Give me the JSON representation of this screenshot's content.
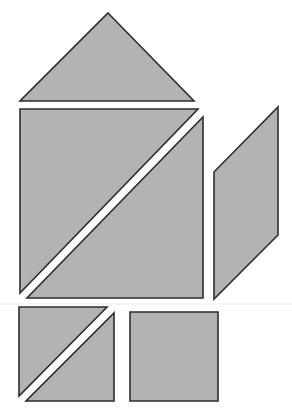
{
  "diagram": {
    "title": "",
    "colors": {
      "fill": "#b3b3b3",
      "stroke": "#2e2e2e",
      "background": "#ffffff",
      "faint_line": "#eeeeee"
    },
    "pieces": [
      {
        "id": "top-triangle",
        "shape": "triangle",
        "points": "108,13 194,101 20,101"
      },
      {
        "id": "big-triangle-upper-left",
        "shape": "triangle",
        "points": "20,109 198,109 20,293"
      },
      {
        "id": "big-triangle-lower-right",
        "shape": "triangle",
        "points": "203,117 203,298 27,298"
      },
      {
        "id": "parallelogram",
        "shape": "parallelogram",
        "points": "278,107 278,235 214,299 214,172"
      },
      {
        "id": "small-triangle-upper-left",
        "shape": "triangle",
        "points": "19,307 107,307 19,396"
      },
      {
        "id": "small-triangle-lower-right",
        "shape": "triangle",
        "points": "114,313 114,401 26,401"
      },
      {
        "id": "square",
        "shape": "square",
        "points": "130,312 218,312 218,401 130,401"
      }
    ],
    "faint_line": {
      "x1": 0,
      "y1": 304,
      "x2": 292,
      "y2": 304
    }
  }
}
